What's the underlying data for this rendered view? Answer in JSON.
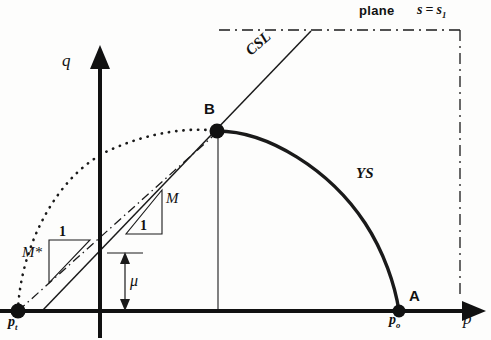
{
  "figure": {
    "domain": "soil-mechanics-yield-surface-diagram",
    "background_color": "#fdfdfc",
    "ink_color": "#111111"
  },
  "axes": {
    "x_label": "p",
    "y_label": "q",
    "origin_px": [
      100,
      311
    ],
    "x_axis_end_px": [
      483,
      311
    ],
    "y_axis_end_px": [
      100,
      52
    ]
  },
  "points": [
    {
      "id": "pt",
      "label": "p",
      "subscript": "t",
      "x_px": 18,
      "y_px": 311,
      "marker": "filled-dot"
    },
    {
      "id": "po",
      "label": "p",
      "subscript": "o",
      "x_px": 399,
      "y_px": 311,
      "marker": "filled-dot"
    },
    {
      "id": "A",
      "label": "A",
      "x_px": 399,
      "y_px": 311,
      "marker": "label-only"
    },
    {
      "id": "B",
      "label": "B",
      "x_px": 217,
      "y_px": 131,
      "marker": "filled-dot"
    }
  ],
  "curves": {
    "yield_surface": {
      "label": "YS",
      "style": "solid-thick",
      "description": "elliptical yield surface from apex B down to point A on the p axis"
    },
    "dotted_reference": {
      "label": "",
      "style": "dotted",
      "description": "dotted reference yield surface arc from p_t up to B"
    },
    "critical_state_line": {
      "label": "CSL",
      "style": "solid-thin",
      "description": "critical state line passing through B, from p axis up to top right"
    },
    "m_star_line": {
      "label": "M*",
      "style": "dash-dot",
      "description": "dash-dot line from p_t through B"
    },
    "suction_plane": {
      "style": "dash-dot",
      "description": "dash-dot boundary marking the constant suction plane"
    }
  },
  "annotations": {
    "slope_M": {
      "rise_label": "M",
      "run_label": "1"
    },
    "slope_M_star": {
      "rise_label": "1",
      "run_label": "M*"
    },
    "mu_dimension": {
      "label": "μ",
      "description": "vertical double arrow from p axis to CSL intercept on q axis"
    },
    "plane_label": "plane",
    "suction_expr_lhs": "s",
    "suction_expr_op": "=",
    "suction_expr_rhs": "s",
    "suction_expr_sub": "1"
  }
}
